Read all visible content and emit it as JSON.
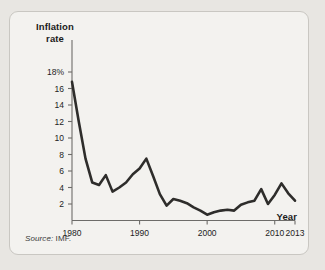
{
  "figure": {
    "source_note_lead": "Source:",
    "source_note_body": " IMF.",
    "frame_color": "#c9c7c2",
    "background_color": "#f3f2ef",
    "page_background": "#e8e6e2"
  },
  "chart_data": {
    "type": "line",
    "title": "",
    "subtitle": "",
    "xlabel": "Year",
    "ylabel": "Inflation rate",
    "ylabel_line1": "Inflation",
    "ylabel_line2": "rate",
    "line_color": "#2e2d2b",
    "grid": false,
    "legend": "none",
    "xlim": [
      1980,
      2013
    ],
    "ylim": [
      0,
      18
    ],
    "xticks": [
      1980,
      1990,
      2000,
      2010,
      2013
    ],
    "xtick_labels": [
      "1980",
      "1990",
      "2000",
      "2010",
      "2013"
    ],
    "yticks": [
      2,
      4,
      6,
      8,
      10,
      12,
      14,
      16,
      18
    ],
    "ytick_labels": [
      "2",
      "4",
      "6",
      "8",
      "10",
      "12",
      "14",
      "16",
      "18%"
    ],
    "x": [
      1980,
      1981,
      1982,
      1983,
      1984,
      1985,
      1986,
      1987,
      1988,
      1989,
      1990,
      1991,
      1992,
      1993,
      1994,
      1995,
      1996,
      1997,
      1998,
      1999,
      2000,
      2001,
      2002,
      2003,
      2004,
      2005,
      2006,
      2007,
      2008,
      2009,
      2010,
      2011,
      2012,
      2013
    ],
    "values": [
      16.8,
      12.0,
      7.5,
      4.6,
      4.3,
      5.5,
      3.5,
      4.0,
      4.6,
      5.6,
      6.3,
      7.5,
      5.4,
      3.2,
      1.8,
      2.6,
      2.4,
      2.1,
      1.6,
      1.2,
      0.7,
      1.0,
      1.2,
      1.3,
      1.2,
      1.9,
      2.2,
      2.4,
      3.8,
      2.0,
      3.1,
      4.5,
      3.3,
      2.4
    ],
    "series": [
      {
        "name": "Inflation rate",
        "values": [
          16.8,
          12.0,
          7.5,
          4.6,
          4.3,
          5.5,
          3.5,
          4.0,
          4.6,
          5.6,
          6.3,
          7.5,
          5.4,
          3.2,
          1.8,
          2.6,
          2.4,
          2.1,
          1.6,
          1.2,
          0.7,
          1.0,
          1.2,
          1.3,
          1.2,
          1.9,
          2.2,
          2.4,
          3.8,
          2.0,
          3.1,
          4.5,
          3.3,
          2.4
        ]
      }
    ]
  }
}
